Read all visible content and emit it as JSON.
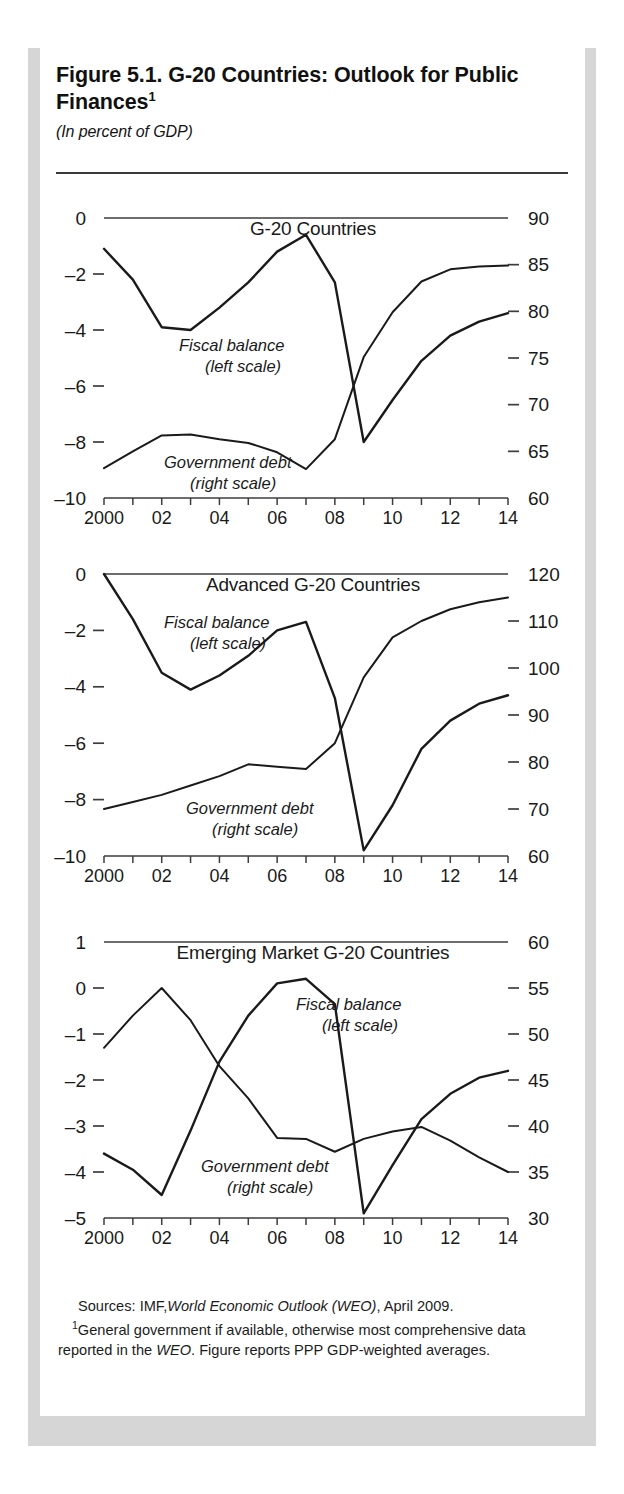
{
  "figure": {
    "title": "Figure 5.1.  G-20 Countries: Outlook for Public Finances",
    "title_superscript": "1",
    "subtitle": "(In percent of GDP)",
    "sources_label": "Sources:",
    "sources_text_a": "IMF,",
    "sources_text_italic": "World Economic Outlook (WEO)",
    "sources_text_b": ", April 2009.",
    "note_marker": "1",
    "note_part_a": "General government if available, otherwise most comprehensive data reported in the ",
    "note_italic": "WEO",
    "note_part_b": ". Figure reports PPP GDP-weighted averages."
  },
  "series_labels": {
    "fiscal_balance": "Fiscal balance",
    "fiscal_balance_scale": "(left scale)",
    "government_debt": "Government debt",
    "government_debt_scale": "(right scale)"
  },
  "chart_data": [
    {
      "type": "line",
      "title": "G-20 Countries",
      "xlabel": "",
      "ylabel": "",
      "grid": false,
      "legend": "inline-annotations",
      "x": [
        2000,
        2001,
        2002,
        2003,
        2004,
        2005,
        2006,
        2007,
        2008,
        2009,
        2010,
        2011,
        2012,
        2013,
        2014
      ],
      "xtick_labels": [
        "2000",
        "",
        "02",
        "",
        "04",
        "",
        "06",
        "",
        "08",
        "",
        "10",
        "",
        "12",
        "",
        "14"
      ],
      "xlim": [
        2000,
        2014
      ],
      "left_axis": {
        "ylim": [
          -10,
          0
        ],
        "ticks": [
          0,
          -2,
          -4,
          -6,
          -8,
          -10
        ],
        "tick_labels": [
          "0",
          "–2",
          "–4",
          "–6",
          "–8",
          "–10"
        ]
      },
      "right_axis": {
        "ylim": [
          60,
          90
        ],
        "ticks": [
          90,
          85,
          80,
          75,
          70,
          65,
          60
        ],
        "tick_labels": [
          "90",
          "85",
          "80",
          "75",
          "70",
          "65",
          "60"
        ]
      },
      "series": [
        {
          "name": "Fiscal balance",
          "axis": "left",
          "values": [
            -1.1,
            -2.2,
            -3.9,
            -4.0,
            -3.2,
            -2.3,
            -1.2,
            -0.6,
            -2.3,
            -8.0,
            -6.5,
            -5.1,
            -4.2,
            -3.7,
            -3.4
          ]
        },
        {
          "name": "Government debt",
          "axis": "right",
          "values": [
            63.2,
            65.0,
            66.7,
            66.8,
            66.3,
            65.9,
            64.9,
            63.1,
            66.3,
            75.1,
            79.9,
            83.2,
            84.5,
            84.8,
            84.9
          ]
        }
      ]
    },
    {
      "type": "line",
      "title": "Advanced G-20 Countries",
      "xlabel": "",
      "ylabel": "",
      "grid": false,
      "legend": "inline-annotations",
      "x": [
        2000,
        2001,
        2002,
        2003,
        2004,
        2005,
        2006,
        2007,
        2008,
        2009,
        2010,
        2011,
        2012,
        2013,
        2014
      ],
      "xtick_labels": [
        "2000",
        "",
        "02",
        "",
        "04",
        "",
        "06",
        "",
        "08",
        "",
        "10",
        "",
        "12",
        "",
        "14"
      ],
      "xlim": [
        2000,
        2014
      ],
      "left_axis": {
        "ylim": [
          -10,
          0
        ],
        "ticks": [
          0,
          -2,
          -4,
          -6,
          -8,
          -10
        ],
        "tick_labels": [
          "0",
          "–2",
          "–4",
          "–6",
          "–8",
          "–10"
        ]
      },
      "right_axis": {
        "ylim": [
          60,
          120
        ],
        "ticks": [
          120,
          110,
          100,
          90,
          80,
          70,
          60
        ],
        "tick_labels": [
          "120",
          "110",
          "100",
          "90",
          "80",
          "70",
          "60"
        ]
      },
      "series": [
        {
          "name": "Fiscal balance",
          "axis": "left",
          "values": [
            0.0,
            -1.6,
            -3.5,
            -4.1,
            -3.6,
            -2.9,
            -2.0,
            -1.7,
            -4.4,
            -9.8,
            -8.2,
            -6.2,
            -5.2,
            -4.6,
            -4.3
          ]
        },
        {
          "name": "Government debt",
          "axis": "right",
          "values": [
            70.0,
            71.5,
            73.0,
            75.0,
            77.0,
            79.5,
            79.0,
            78.5,
            84.0,
            98.0,
            106.5,
            110.0,
            112.5,
            114.0,
            115.0
          ]
        }
      ]
    },
    {
      "type": "line",
      "title": "Emerging Market G-20 Countries",
      "xlabel": "",
      "ylabel": "",
      "grid": false,
      "legend": "inline-annotations",
      "x": [
        2000,
        2001,
        2002,
        2003,
        2004,
        2005,
        2006,
        2007,
        2008,
        2009,
        2010,
        2011,
        2012,
        2013,
        2014
      ],
      "xtick_labels": [
        "2000",
        "",
        "02",
        "",
        "04",
        "",
        "06",
        "",
        "08",
        "",
        "10",
        "",
        "12",
        "",
        "14"
      ],
      "xlim": [
        2000,
        2014
      ],
      "left_axis": {
        "ylim": [
          -5,
          1
        ],
        "ticks": [
          1,
          0,
          -1,
          -2,
          -3,
          -4,
          -5
        ],
        "tick_labels": [
          "1",
          "0",
          "–1",
          "–2",
          "–3",
          "–4",
          "–5"
        ]
      },
      "right_axis": {
        "ylim": [
          30,
          60
        ],
        "ticks": [
          60,
          55,
          50,
          45,
          40,
          35,
          30
        ],
        "tick_labels": [
          "60",
          "55",
          "50",
          "45",
          "40",
          "35",
          "30"
        ]
      },
      "series": [
        {
          "name": "Fiscal balance",
          "axis": "left",
          "values": [
            -3.6,
            -3.95,
            -4.5,
            -3.1,
            -1.6,
            -0.6,
            0.1,
            0.2,
            -0.35,
            -4.9,
            -3.85,
            -2.85,
            -2.3,
            -1.95,
            -1.8
          ]
        },
        {
          "name": "Government debt",
          "axis": "right",
          "values": [
            48.5,
            52.0,
            55.0,
            51.5,
            46.5,
            43.0,
            38.7,
            38.6,
            37.2,
            38.6,
            39.4,
            39.9,
            38.4,
            36.6,
            35.0
          ]
        }
      ]
    }
  ]
}
